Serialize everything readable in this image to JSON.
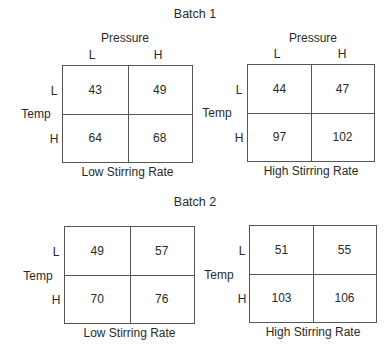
{
  "batches": [
    {
      "title": "Batch 1",
      "tables": [
        {
          "caption": "Low Stirring Rate",
          "column_header": "Pressure",
          "columns": [
            "L",
            "H"
          ],
          "row_header": "Temp",
          "rows": [
            "L",
            "H"
          ],
          "values": [
            [
              "43",
              "49"
            ],
            [
              "64",
              "68"
            ]
          ]
        },
        {
          "caption": "High Stirring Rate",
          "column_header": "Pressure",
          "columns": [
            "L",
            "H"
          ],
          "row_header": "Temp",
          "rows": [
            "L",
            "H"
          ],
          "values": [
            [
              "44",
              "47"
            ],
            [
              "97",
              "102"
            ]
          ]
        }
      ]
    },
    {
      "title": "Batch 2",
      "tables": [
        {
          "caption": "Low Stirring Rate",
          "row_header": "Temp",
          "rows": [
            "L",
            "H"
          ],
          "values": [
            [
              "49",
              "57"
            ],
            [
              "70",
              "76"
            ]
          ]
        },
        {
          "caption": "High Stirring Rate",
          "row_header": "Temp",
          "rows": [
            "L",
            "H"
          ],
          "values": [
            [
              "51",
              "55"
            ],
            [
              "103",
              "106"
            ]
          ]
        }
      ]
    }
  ]
}
